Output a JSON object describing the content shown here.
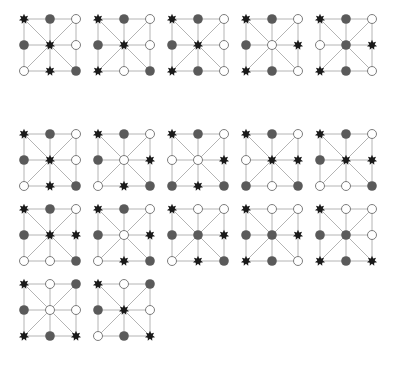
{
  "figure": {
    "legend": {
      "x": "black-star-piece",
      "g": "gray-piece",
      "o": "empty-point"
    },
    "colors": {
      "line": "#b4b4b4",
      "star": "#1a1a1a",
      "gray": "#5a5a5a",
      "empty_fill": "#ffffff",
      "empty_stroke": "#6e6e6e"
    },
    "cell_order": [
      "TL",
      "TM",
      "TR",
      "ML",
      "C",
      "MR",
      "BL",
      "BM",
      "BR"
    ],
    "boards": [
      {
        "id": 1,
        "x": 20,
        "y": 15,
        "cells": [
          "x",
          "g",
          "o",
          "g",
          "x",
          "o",
          "o",
          "x",
          "g"
        ]
      },
      {
        "id": 2,
        "x": 94,
        "y": 15,
        "cells": [
          "x",
          "g",
          "o",
          "g",
          "x",
          "o",
          "x",
          "o",
          "g"
        ]
      },
      {
        "id": 3,
        "x": 168,
        "y": 15,
        "cells": [
          "x",
          "g",
          "o",
          "g",
          "x",
          "o",
          "x",
          "g",
          "o"
        ]
      },
      {
        "id": 4,
        "x": 242,
        "y": 15,
        "cells": [
          "x",
          "g",
          "o",
          "g",
          "o",
          "x",
          "x",
          "g",
          "o"
        ]
      },
      {
        "id": 5,
        "x": 316,
        "y": 15,
        "cells": [
          "x",
          "g",
          "o",
          "o",
          "g",
          "x",
          "x",
          "g",
          "o"
        ]
      },
      {
        "id": 6,
        "x": 20,
        "y": 130,
        "cells": [
          "x",
          "g",
          "o",
          "g",
          "x",
          "o",
          "o",
          "x",
          "g"
        ]
      },
      {
        "id": 7,
        "x": 94,
        "y": 130,
        "cells": [
          "x",
          "g",
          "o",
          "g",
          "o",
          "x",
          "o",
          "x",
          "g"
        ]
      },
      {
        "id": 8,
        "x": 168,
        "y": 130,
        "cells": [
          "x",
          "g",
          "o",
          "o",
          "o",
          "x",
          "g",
          "x",
          "g"
        ]
      },
      {
        "id": 9,
        "x": 242,
        "y": 130,
        "cells": [
          "x",
          "g",
          "o",
          "o",
          "x",
          "x",
          "g",
          "o",
          "g"
        ]
      },
      {
        "id": 10,
        "x": 316,
        "y": 130,
        "cells": [
          "x",
          "g",
          "o",
          "g",
          "x",
          "x",
          "o",
          "o",
          "g"
        ]
      },
      {
        "id": 11,
        "x": 20,
        "y": 205,
        "cells": [
          "x",
          "g",
          "o",
          "g",
          "x",
          "x",
          "o",
          "o",
          "g"
        ]
      },
      {
        "id": 12,
        "x": 94,
        "y": 205,
        "cells": [
          "x",
          "g",
          "o",
          "g",
          "o",
          "x",
          "o",
          "x",
          "g"
        ]
      },
      {
        "id": 13,
        "x": 168,
        "y": 205,
        "cells": [
          "x",
          "o",
          "o",
          "g",
          "g",
          "x",
          "o",
          "x",
          "g"
        ]
      },
      {
        "id": 14,
        "x": 242,
        "y": 205,
        "cells": [
          "x",
          "o",
          "o",
          "g",
          "g",
          "x",
          "x",
          "g",
          "o"
        ]
      },
      {
        "id": 15,
        "x": 316,
        "y": 205,
        "cells": [
          "x",
          "o",
          "o",
          "g",
          "g",
          "o",
          "x",
          "g",
          "x"
        ]
      },
      {
        "id": 16,
        "x": 20,
        "y": 280,
        "cells": [
          "x",
          "o",
          "g",
          "g",
          "o",
          "o",
          "x",
          "g",
          "x"
        ]
      },
      {
        "id": 17,
        "x": 94,
        "y": 280,
        "cells": [
          "x",
          "o",
          "g",
          "g",
          "x",
          "o",
          "o",
          "g",
          "x"
        ]
      }
    ]
  }
}
